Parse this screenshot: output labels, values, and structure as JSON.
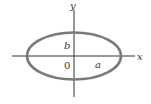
{
  "diagram": {
    "type": "ellipse-on-axes",
    "labels": {
      "x_axis": "x",
      "y_axis": "y",
      "origin": "0",
      "semi_major": "a",
      "semi_minor": "b"
    },
    "colors": {
      "ellipse": "#7a7a7a",
      "axes": "#333333",
      "text": "#333333"
    }
  }
}
